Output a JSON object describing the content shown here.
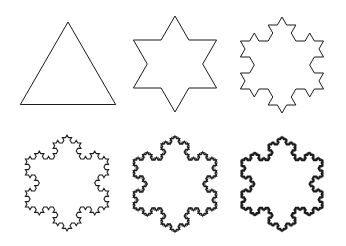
{
  "figure": {
    "stroke_color": "#1a1a1a",
    "background": "#ffffff",
    "panels": [
      {
        "iteration": 0,
        "cx": 68,
        "cy": 77,
        "radius": 55,
        "stroke_width": 1.0
      },
      {
        "iteration": 1,
        "cx": 175,
        "cy": 64,
        "radius": 48,
        "stroke_width": 1.0
      },
      {
        "iteration": 2,
        "cx": 282,
        "cy": 65,
        "radius": 48,
        "stroke_width": 1.0
      },
      {
        "iteration": 3,
        "cx": 67,
        "cy": 183,
        "radius": 48,
        "stroke_width": 1.1
      },
      {
        "iteration": 4,
        "cx": 175,
        "cy": 184,
        "radius": 48,
        "stroke_width": 1.3
      },
      {
        "iteration": 5,
        "cx": 282,
        "cy": 184,
        "radius": 47,
        "stroke_width": 1.4
      }
    ]
  }
}
